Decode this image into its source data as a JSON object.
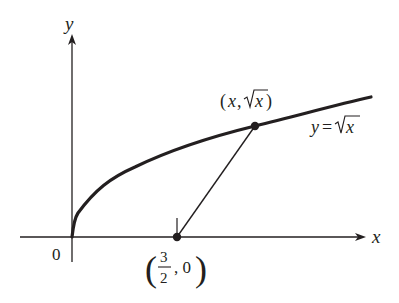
{
  "diagram": {
    "colors": {
      "ink": "#231f20",
      "background": "#ffffff"
    },
    "axes": {
      "x_label": "x",
      "y_label": "y",
      "origin_label": "0"
    },
    "curve": {
      "equation_lhs": "y = ",
      "equation_radicand": "x",
      "function": "sqrt(x)",
      "x_range": [
        0,
        4.25
      ]
    },
    "points": [
      {
        "name": "fixed-point",
        "label_num": "3",
        "label_den": "2",
        "label_rest": ", 0",
        "coords": [
          1.5,
          0
        ]
      },
      {
        "name": "curve-point",
        "label_open": "(",
        "label_x": "x",
        "label_sep": ", ",
        "label_radicand": "x",
        "label_close": ")",
        "coords": [
          "x",
          "sqrt(x)"
        ]
      }
    ],
    "segment": {
      "from": [
        1.5,
        0
      ],
      "to": [
        "x",
        "sqrt(x)"
      ]
    }
  }
}
